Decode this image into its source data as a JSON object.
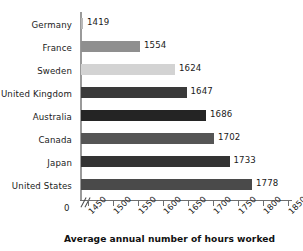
{
  "chart_data": {
    "type": "bar",
    "orientation": "horizontal",
    "title": "",
    "xlabel": "Average annual number of hours worked",
    "ylabel": "",
    "categories": [
      "Germany",
      "France",
      "Sweden",
      "United Kingdom",
      "Australia",
      "Canada",
      "Japan",
      "United States"
    ],
    "values": [
      1419,
      1554,
      1624,
      1647,
      1686,
      1702,
      1733,
      1778
    ],
    "value_labels": [
      "1419",
      "1554",
      "1624",
      "1647",
      "1686",
      "1702",
      "1733",
      "1778"
    ],
    "bar_colors": [
      "#b8b8b8",
      "#8f8f8f",
      "#d3d3d3",
      "#3a3a3a",
      "#242424",
      "#555555",
      "#333333",
      "#4a4a4a"
    ],
    "xlim": [
      1425,
      1860
    ],
    "xticks": [
      1450,
      1500,
      1550,
      1600,
      1650,
      1700,
      1750,
      1800,
      1850
    ],
    "xtick_labels": [
      "1450",
      "1500",
      "1550",
      "1600",
      "1650",
      "1700",
      "1750",
      "1800",
      "1850"
    ],
    "axis_origin_label": "0",
    "axis_break": true,
    "grid": false,
    "legend": null
  },
  "colors": {
    "axis": "#6f8f8f",
    "axis_vertical": "#9a9a9a",
    "text": "#1a1a1a",
    "background": "#ffffff"
  }
}
